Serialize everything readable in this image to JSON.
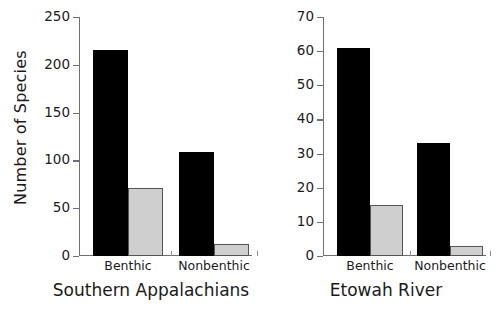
{
  "chart_data": [
    {
      "type": "bar",
      "title": "Southern Appalachians",
      "xlabel": "",
      "ylabel": "Number of Species",
      "categories": [
        "Benthic",
        "Nonbenthic"
      ],
      "series": [
        {
          "name": "black-series",
          "color": "#000000",
          "values": [
            215,
            109
          ]
        },
        {
          "name": "gray-series",
          "color": "#cfcfcf",
          "values": [
            71,
            13
          ]
        }
      ],
      "ylim": [
        0,
        250
      ],
      "yticks": [
        0,
        50,
        100,
        150,
        200,
        250
      ],
      "ytick_labels": [
        "0",
        "50",
        "100",
        "150",
        "200",
        "250"
      ],
      "grid": false,
      "legend": "none"
    },
    {
      "type": "bar",
      "title": "Etowah River",
      "xlabel": "",
      "ylabel": "",
      "categories": [
        "Benthic",
        "Nonbenthic"
      ],
      "series": [
        {
          "name": "black-series",
          "color": "#000000",
          "values": [
            61,
            33
          ]
        },
        {
          "name": "gray-series",
          "color": "#cfcfcf",
          "values": [
            15,
            3
          ]
        }
      ],
      "ylim": [
        0,
        70
      ],
      "yticks": [
        0,
        10,
        20,
        30,
        40,
        50,
        60,
        70
      ],
      "ytick_labels": [
        "0",
        "10",
        "20",
        "30",
        "40",
        "50",
        "60",
        "70"
      ],
      "grid": false,
      "legend": "none"
    }
  ],
  "colors": {
    "bar_dark": "#000000",
    "bar_light": "#cfcfcf",
    "axis": "#6f6f6f",
    "text": "#1a1a1a",
    "background": "#ffffff"
  }
}
